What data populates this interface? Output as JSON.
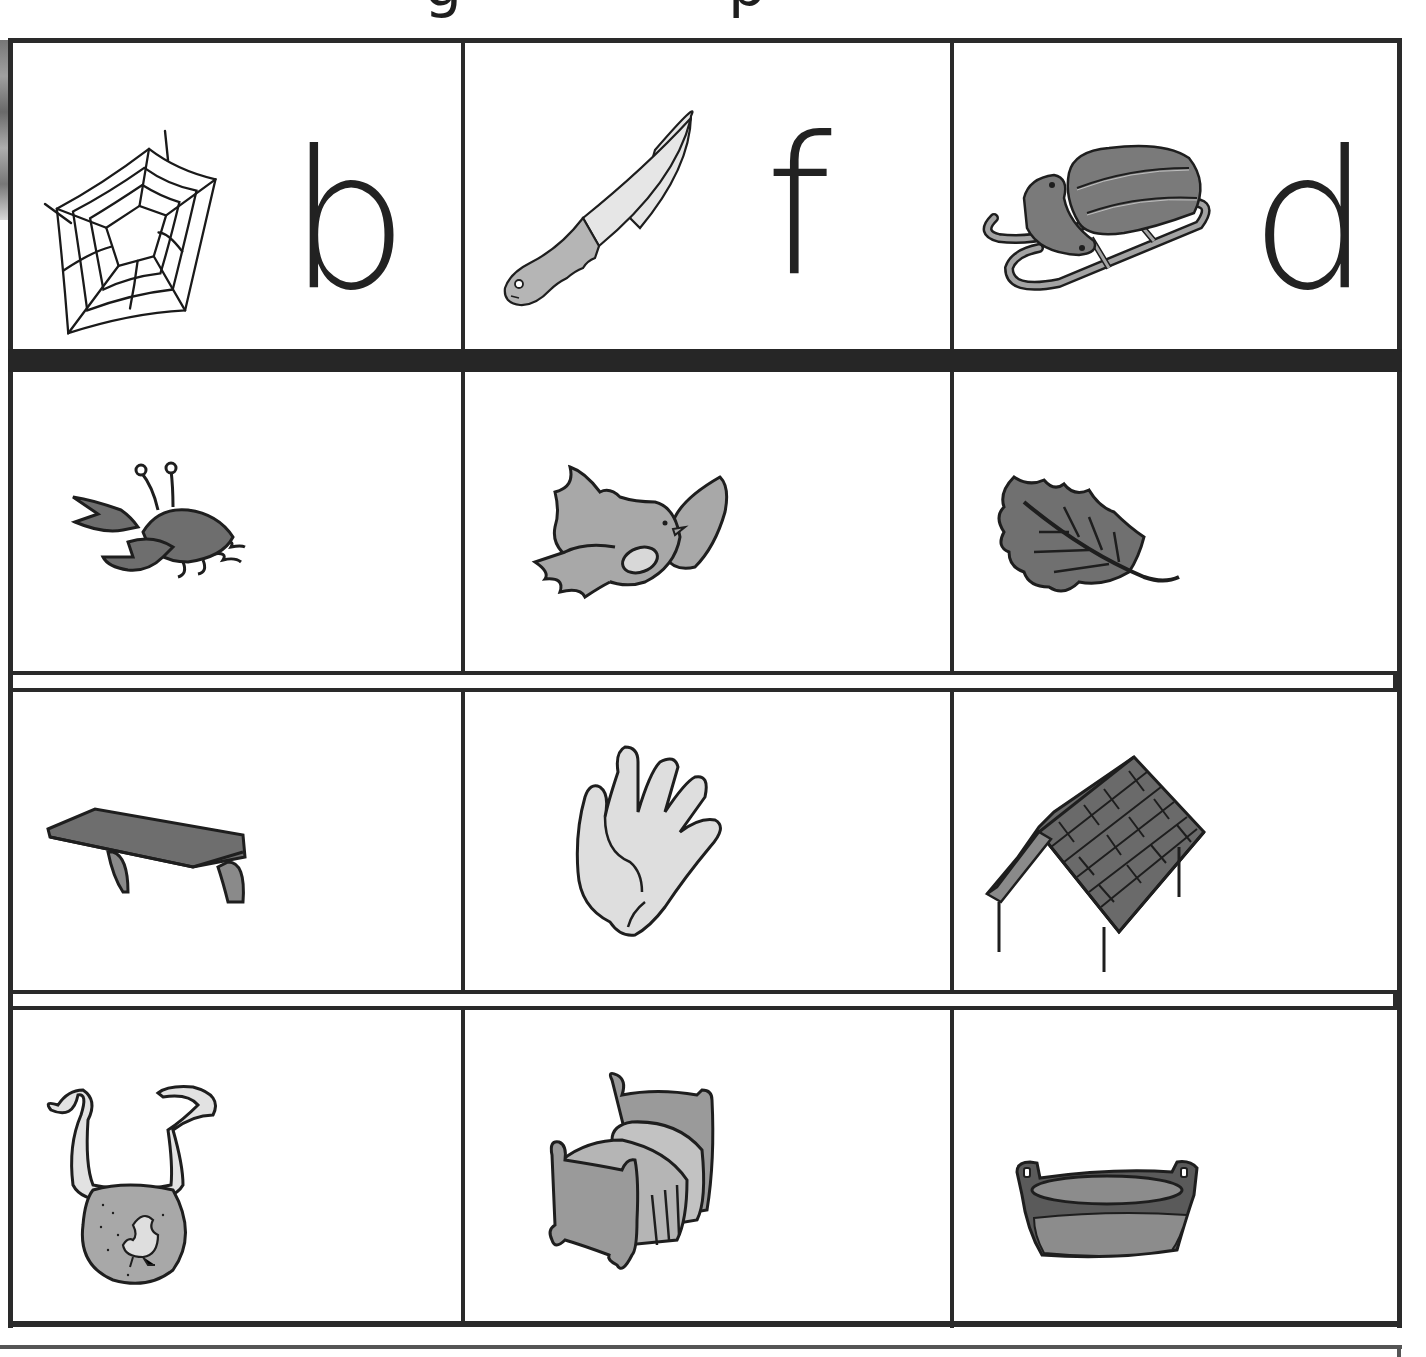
{
  "page": {
    "cut_off_heading_fragments": [
      "g",
      "p"
    ],
    "colors": {
      "grid_line": "#2a2a2a",
      "fill_light": "#d9d9d9",
      "fill_mid": "#a8a8a8",
      "fill_dark": "#6e6e6e",
      "outline": "#1e1e1e"
    }
  },
  "worksheet": {
    "header_row": [
      {
        "picture": "spider-web",
        "letter": "b"
      },
      {
        "picture": "knife",
        "letter": "f"
      },
      {
        "picture": "sled",
        "letter": "d"
      }
    ],
    "picture_rows": [
      [
        {
          "picture": "crab"
        },
        {
          "picture": "bird"
        },
        {
          "picture": "leaf"
        }
      ],
      [
        {
          "picture": "shelf"
        },
        {
          "picture": "glove-hand"
        },
        {
          "picture": "roof"
        }
      ],
      [
        {
          "picture": "bib"
        },
        {
          "picture": "bed"
        },
        {
          "picture": "tub"
        }
      ]
    ]
  }
}
